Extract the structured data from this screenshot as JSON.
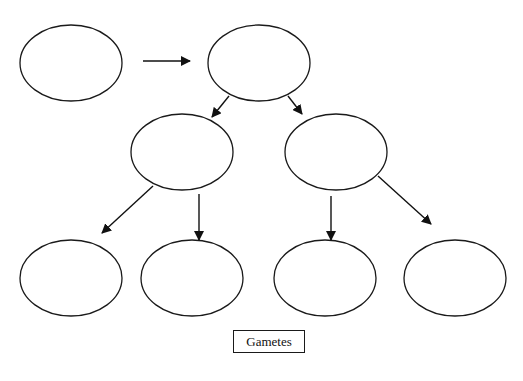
{
  "diagram": {
    "type": "flow-tree",
    "colors": {
      "stroke": "#1a1a1a",
      "fill": "#ffffff",
      "background": "#ffffff"
    },
    "nodes": [
      {
        "id": "cell-1",
        "label": "",
        "cx": 71,
        "cy": 63,
        "rx": 51,
        "ry": 38
      },
      {
        "id": "cell-2",
        "label": "",
        "cx": 259,
        "cy": 63,
        "rx": 51,
        "ry": 38
      },
      {
        "id": "cell-3",
        "label": "",
        "cx": 182,
        "cy": 152,
        "rx": 51,
        "ry": 38
      },
      {
        "id": "cell-4",
        "label": "",
        "cx": 336,
        "cy": 152,
        "rx": 51,
        "ry": 38
      },
      {
        "id": "gamete-1",
        "label": "",
        "cx": 71,
        "cy": 278,
        "rx": 51,
        "ry": 38
      },
      {
        "id": "gamete-2",
        "label": "",
        "cx": 192,
        "cy": 278,
        "rx": 51,
        "ry": 38
      },
      {
        "id": "gamete-3",
        "label": "",
        "cx": 325,
        "cy": 278,
        "rx": 51,
        "ry": 38
      },
      {
        "id": "gamete-4",
        "label": "",
        "cx": 455,
        "cy": 278,
        "rx": 51,
        "ry": 38
      }
    ],
    "edges": [
      {
        "from": "cell-1",
        "to": "cell-2"
      },
      {
        "from": "cell-2",
        "to": "cell-3"
      },
      {
        "from": "cell-2",
        "to": "cell-4"
      },
      {
        "from": "cell-3",
        "to": "gamete-1"
      },
      {
        "from": "cell-3",
        "to": "gamete-2"
      },
      {
        "from": "cell-4",
        "to": "gamete-3"
      },
      {
        "from": "cell-4",
        "to": "gamete-4"
      }
    ],
    "label": "Gametes"
  }
}
